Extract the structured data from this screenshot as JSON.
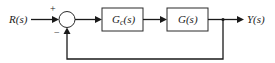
{
  "diagram": {
    "type": "feedback-control-block-diagram",
    "input": {
      "label": "R(s)"
    },
    "output": {
      "label": "Y(s)"
    },
    "summing_junction": {
      "plus_sign": "+",
      "minus_sign": "−"
    },
    "blocks": [
      {
        "id": "controller",
        "label_main": "G",
        "label_sub": "c",
        "label_tail": "(s)"
      },
      {
        "id": "plant",
        "label_main": "G",
        "label_sub": "",
        "label_tail": "(s)"
      }
    ],
    "feedback": {
      "type": "unity negative feedback"
    },
    "colors": {
      "line": "#1a1a1a",
      "background": "#ffffff"
    }
  }
}
